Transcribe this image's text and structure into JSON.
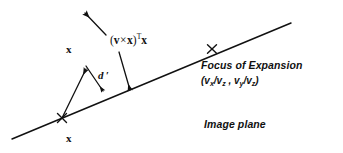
{
  "figure": {
    "background_color": "#ffffff",
    "ink_color": "#111111",
    "width": 343,
    "height": 153
  },
  "labels": {
    "x_upper": "x",
    "x_lower": "x",
    "cross_term": {
      "open_paren": "(",
      "v": "v",
      "times": "×",
      "x_inner": "x",
      "close_paren": ")",
      "transpose": "T",
      "x_outer": "x",
      "plain": "(v×x)ᵀx"
    },
    "d_prime": "d ′",
    "focus_of_expansion": "Focus of Expansion",
    "foe_coords": {
      "open": "(",
      "num_x": "v",
      "sub_x": "x",
      "slash1": "/v",
      "sub_z1": "z",
      "comma": " , ",
      "num_y": "v",
      "sub_y": "y",
      "slash2": "/v",
      "sub_z2": "z",
      "close": ")",
      "plain": "(vx/vz , vy/vz)"
    },
    "image_plane": "Image plane"
  },
  "geometry": {
    "epipolar_line": {
      "x1": 12,
      "y1": 139,
      "x2": 291,
      "y2": 23
    },
    "marker_x_point": {
      "cx": 62,
      "cy": 118,
      "size": 5
    },
    "marker_foe_point": {
      "cx": 212,
      "cy": 49,
      "size": 5
    },
    "vector_x_arrow": {
      "x1": 62,
      "y1": 118,
      "x2": 86,
      "y2": 66
    },
    "d_prime_arrow": {
      "x1": 86,
      "y1": 66,
      "x2": 104,
      "y2": 93
    },
    "cross_product_arrow": {
      "x1": 105,
      "y1": 34,
      "x2": 85,
      "y2": 12
    },
    "cross_product_down_arrow": {
      "x1": 119,
      "y1": 52,
      "x2": 130,
      "y2": 92
    }
  }
}
